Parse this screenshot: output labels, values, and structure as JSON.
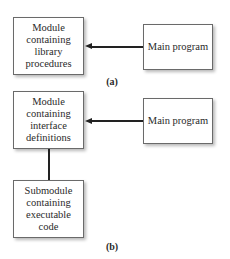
{
  "diagram_a": {
    "module_box": {
      "lines": [
        "Module",
        "containing",
        "library",
        "procedures"
      ]
    },
    "main_box": {
      "text": "Main program"
    },
    "arrow": {
      "from": "main_program",
      "to": "module",
      "direction": "left"
    },
    "caption": "(a)"
  },
  "diagram_b": {
    "module_box": {
      "lines": [
        "Module",
        "containing",
        "interface",
        "definitions"
      ]
    },
    "main_box": {
      "text": "Main program"
    },
    "submodule_box": {
      "lines": [
        "Submodule",
        "containing",
        "executable",
        "code"
      ]
    },
    "arrow": {
      "from": "main_program",
      "to": "module",
      "direction": "left"
    },
    "connector": {
      "from": "module",
      "to": "submodule",
      "type": "line"
    },
    "caption": "(b)"
  }
}
